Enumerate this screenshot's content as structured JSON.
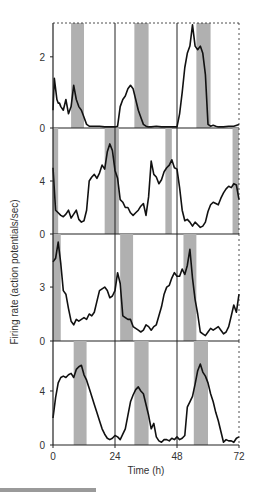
{
  "chart_data": [
    {
      "type": "line",
      "panel": 1,
      "x": [
        0,
        0.5,
        1,
        1.5,
        2,
        2.5,
        3,
        4,
        5,
        6,
        7,
        8,
        9,
        10,
        11,
        12,
        13,
        14,
        15,
        16,
        18,
        20,
        22,
        24,
        25,
        26,
        27,
        28,
        29,
        30,
        31,
        32,
        33,
        34,
        35,
        36,
        37,
        38,
        40,
        42,
        44,
        46,
        48,
        49,
        50,
        51,
        52,
        53,
        54,
        55,
        56,
        57,
        58,
        59,
        60,
        61,
        62,
        63,
        64,
        66,
        68,
        70,
        72
      ],
      "y": [
        0.5,
        1.4,
        1.1,
        0.8,
        0.7,
        0.7,
        0.6,
        0.5,
        0.8,
        0.4,
        0.6,
        1.2,
        0.8,
        0.6,
        0.5,
        0.3,
        0.1,
        0.05,
        0.05,
        0.05,
        0.05,
        0.03,
        0.03,
        0.03,
        0.05,
        0.6,
        0.8,
        0.9,
        1.1,
        1.2,
        1.1,
        0.8,
        0.5,
        0.3,
        0.1,
        0.05,
        0.03,
        0.03,
        0.05,
        0.03,
        0.03,
        0.03,
        0.03,
        0.4,
        1.0,
        1.7,
        2.1,
        2.3,
        2.9,
        2.3,
        2.2,
        2.3,
        2.1,
        1.5,
        0.1,
        0.05,
        0.08,
        0.05,
        0.03,
        0.03,
        0.05,
        0.05,
        0.1
      ],
      "ylim": [
        0,
        2.95
      ],
      "yticks": [
        0,
        2
      ],
      "shaded": [
        [
          7,
          12
        ],
        [
          31.5,
          37
        ],
        [
          55.5,
          61
        ]
      ]
    },
    {
      "type": "line",
      "panel": 2,
      "x": [
        0,
        1,
        2,
        3,
        4,
        5,
        6,
        7,
        8,
        9,
        10,
        11,
        12,
        13,
        14,
        15,
        16,
        17,
        18,
        19,
        20,
        21,
        22,
        23,
        24,
        25,
        26,
        27,
        28,
        29,
        30,
        31,
        32,
        33,
        34,
        35,
        36,
        37,
        38,
        39,
        40,
        41,
        42,
        43,
        44,
        45,
        46,
        47,
        48,
        49,
        50,
        51,
        52,
        53,
        54,
        55,
        56,
        57,
        58,
        59,
        60,
        61,
        62,
        63,
        64,
        65,
        66,
        67,
        68,
        69,
        70,
        71,
        72
      ],
      "y": [
        5.0,
        1.8,
        1.6,
        1.4,
        1.3,
        1.5,
        1.8,
        1.2,
        1.5,
        1.8,
        1.1,
        0.9,
        1.0,
        1.8,
        4.0,
        4.3,
        4.5,
        4.2,
        4.6,
        5.2,
        4.9,
        6.2,
        6.8,
        6.3,
        4.8,
        4.2,
        2.6,
        2.4,
        2.0,
        2.0,
        1.6,
        1.4,
        1.6,
        1.8,
        2.1,
        2.3,
        1.4,
        2.8,
        5.5,
        4.5,
        4.3,
        3.8,
        4.1,
        4.7,
        5.0,
        5.2,
        5.6,
        5.0,
        4.9,
        3.5,
        1.8,
        1.0,
        1.1,
        0.9,
        0.6,
        0.9,
        0.7,
        0.5,
        0.6,
        0.9,
        1.7,
        2.2,
        2.4,
        2.3,
        2.2,
        2.7,
        3.1,
        3.4,
        3.6,
        3.5,
        3.8,
        3.7,
        2.6
      ],
      "ylim": [
        0,
        8
      ],
      "yticks": [
        0,
        4
      ],
      "shaded": [
        [
          0,
          2
        ],
        [
          20,
          25.5
        ],
        [
          43.5,
          46
        ],
        [
          69.5,
          72
        ]
      ]
    },
    {
      "type": "line",
      "panel": 3,
      "x": [
        0,
        1,
        2,
        3,
        4,
        5,
        6,
        7,
        8,
        9,
        10,
        11,
        12,
        13,
        14,
        15,
        16,
        17,
        18,
        19,
        20,
        21,
        22,
        23,
        24,
        25,
        26,
        27,
        28,
        29,
        30,
        31,
        32,
        33,
        34,
        35,
        36,
        37,
        38,
        39,
        40,
        41,
        42,
        43,
        44,
        45,
        46,
        47,
        48,
        49,
        50,
        51,
        52,
        53,
        54,
        55,
        56,
        57,
        58,
        59,
        60,
        61,
        62,
        63,
        64,
        65,
        66,
        67,
        68,
        69,
        70,
        71,
        72
      ],
      "y": [
        4.4,
        4.6,
        5.5,
        4.3,
        2.8,
        2.6,
        1.8,
        1.1,
        0.9,
        1.2,
        1.1,
        1.2,
        1.3,
        1.2,
        1.5,
        1.4,
        1.6,
        2.2,
        2.8,
        2.9,
        3.0,
        2.8,
        2.4,
        2.5,
        2.8,
        3.8,
        3.2,
        1.4,
        1.3,
        1.2,
        1.2,
        0.8,
        0.7,
        0.6,
        0.5,
        0.6,
        0.9,
        0.8,
        0.6,
        0.8,
        0.9,
        1.4,
        1.9,
        2.6,
        3.0,
        3.1,
        3.5,
        3.8,
        3.6,
        3.6,
        4.0,
        3.7,
        4.2,
        5.1,
        3.5,
        2.3,
        1.5,
        0.5,
        0.4,
        0.3,
        0.5,
        0.7,
        0.6,
        0.7,
        0.8,
        0.6,
        0.4,
        0.5,
        0.8,
        1.4,
        2.0,
        1.6,
        2.6
      ],
      "ylim": [
        0,
        5.95
      ],
      "yticks": [
        0,
        3
      ],
      "shaded": [
        [
          0,
          3
        ],
        [
          26,
          31
        ],
        [
          50.5,
          55.5
        ]
      ]
    },
    {
      "type": "line",
      "panel": 4,
      "x": [
        0,
        1,
        2,
        3,
        4,
        5,
        6,
        7,
        8,
        9,
        10,
        11,
        12,
        13,
        14,
        15,
        16,
        17,
        18,
        19,
        20,
        21,
        22,
        23,
        24,
        25,
        26,
        27,
        28,
        29,
        30,
        31,
        32,
        33,
        34,
        35,
        36,
        37,
        38,
        39,
        40,
        41,
        42,
        43,
        44,
        45,
        46,
        47,
        48,
        49,
        50,
        51,
        52,
        53,
        54,
        55,
        56,
        57,
        58,
        59,
        60,
        61,
        62,
        63,
        64,
        65,
        66,
        67,
        68,
        69,
        70,
        71,
        72
      ],
      "y": [
        2.0,
        3.5,
        4.6,
        5.0,
        5.1,
        5.0,
        5.2,
        5.3,
        5.0,
        5.6,
        5.8,
        5.9,
        5.2,
        4.8,
        4.2,
        3.6,
        3.0,
        2.4,
        1.8,
        1.2,
        0.8,
        0.5,
        0.4,
        0.5,
        0.7,
        0.6,
        0.4,
        0.8,
        1.2,
        2.2,
        3.2,
        3.7,
        4.1,
        4.3,
        4.0,
        3.8,
        3.0,
        2.2,
        1.2,
        1.6,
        0.6,
        0.3,
        0.2,
        0.4,
        0.4,
        0.3,
        0.5,
        0.4,
        0.6,
        0.4,
        0.5,
        0.7,
        2.8,
        3.2,
        3.6,
        4.5,
        5.5,
        6.0,
        5.4,
        5.1,
        4.6,
        3.8,
        3.2,
        2.4,
        1.8,
        1.0,
        0.2,
        0.4,
        0.3,
        0.3,
        0.2,
        0.5,
        0.6
      ],
      "ylim": [
        0,
        7.7
      ],
      "yticks": [
        0,
        4
      ],
      "shaded": [
        [
          8,
          13
        ],
        [
          31.5,
          37
        ],
        [
          54.5,
          60
        ]
      ]
    }
  ],
  "axes": {
    "xlabel": "Time (h)",
    "ylabel": "Firing rate (action potentials/sec)",
    "xticks": [
      0,
      24,
      48,
      72
    ],
    "xlim": [
      0,
      72
    ],
    "vertical_lines": [
      24,
      48
    ]
  },
  "colors": {
    "line": "#111111",
    "shade": "#b0b0b0",
    "axis": "#222222",
    "text": "#333333"
  }
}
